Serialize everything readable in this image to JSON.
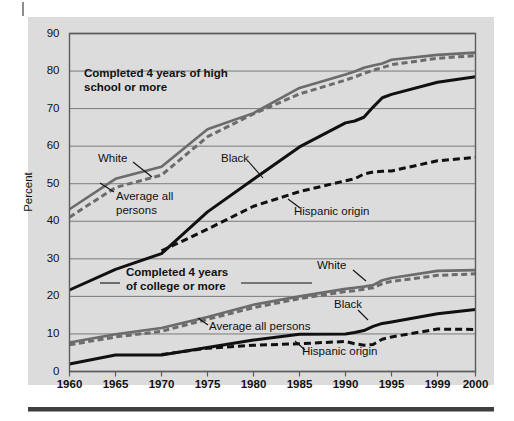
{
  "figure": {
    "background_color": "#dcdcdc",
    "plot_frame_color": "#5c5c5c",
    "gridline_color": "#6e6e6e",
    "series_gray_color": "#6b6b6b",
    "series_black_color": "#101010"
  },
  "axes": {
    "ylabel": "Percent",
    "yticks": [
      "0",
      "10",
      "20",
      "30",
      "40",
      "50",
      "60",
      "70",
      "80",
      "90"
    ],
    "xticks": [
      "1960",
      "1965",
      "1970",
      "1975",
      "1980",
      "1985",
      "1990",
      "1995",
      "1999",
      "2000"
    ]
  },
  "annotations": {
    "hs_title_line1": "Completed 4 years of high",
    "hs_title_line2": "school or more",
    "hs_white": "White",
    "hs_average_line1": "Average all",
    "hs_average_line2": "persons",
    "hs_black": "Black",
    "hs_hispanic": "Hispanic origin",
    "col_title_line1": "Completed 4 years",
    "col_title_line2": "of college or more",
    "col_white": "White",
    "col_average": "Average all persons",
    "col_black": "Black",
    "col_hispanic": "Hispanic origin"
  },
  "chart_data": {
    "type": "line",
    "title": "",
    "subtitle": "",
    "xlabel": "",
    "ylabel": "Percent",
    "xlim": [
      1960,
      2000
    ],
    "ylim": [
      0,
      90
    ],
    "grid": true,
    "legend": "inline annotations",
    "x": [
      1960,
      1965,
      1970,
      1975,
      1980,
      1985,
      1990,
      1991,
      1992,
      1993,
      1994,
      1995,
      1999,
      2000
    ],
    "series": [
      {
        "name": "Completed 4 years of high school or more - White",
        "group": "high_school",
        "style": "solid",
        "color": "#6b6b6b",
        "values": [
          43.2,
          51.3,
          54.5,
          64.5,
          68.8,
          75.5,
          79.1,
          79.9,
          80.9,
          81.5,
          82.0,
          83.0,
          84.3,
          84.9
        ]
      },
      {
        "name": "Completed 4 years of high school or more - Average all persons",
        "group": "high_school",
        "style": "dashed",
        "color": "#6b6b6b",
        "values": [
          41.1,
          49.0,
          52.3,
          62.5,
          68.6,
          73.9,
          77.6,
          78.4,
          79.4,
          80.2,
          80.9,
          81.7,
          83.4,
          84.1
        ]
      },
      {
        "name": "Completed 4 years of high school or more - Black",
        "group": "high_school",
        "style": "solid",
        "color": "#101010",
        "values": [
          21.7,
          27.2,
          31.4,
          42.5,
          51.2,
          59.8,
          66.2,
          66.7,
          67.7,
          70.4,
          72.9,
          73.8,
          77.0,
          78.5
        ]
      },
      {
        "name": "Completed 4 years of high school or more - Hispanic origin",
        "group": "high_school",
        "style": "dashed",
        "color": "#101010",
        "values": [
          null,
          null,
          32.1,
          37.9,
          44.0,
          47.9,
          50.8,
          51.3,
          52.6,
          53.1,
          53.3,
          53.4,
          56.1,
          57.0
        ]
      },
      {
        "name": "Completed 4 years of college or more - White",
        "group": "college",
        "style": "solid",
        "color": "#6b6b6b",
        "values": [
          7.7,
          9.9,
          11.6,
          14.5,
          17.8,
          20.0,
          22.0,
          22.3,
          22.6,
          23.0,
          24.3,
          24.9,
          26.8,
          27.0
        ]
      },
      {
        "name": "Completed 4 years of college or more - Average all persons",
        "group": "college",
        "style": "dashed",
        "color": "#6b6b6b",
        "values": [
          7.1,
          9.2,
          10.7,
          13.9,
          17.0,
          19.4,
          21.3,
          21.5,
          21.9,
          22.3,
          23.4,
          24.0,
          25.6,
          26.0
        ]
      },
      {
        "name": "Completed 4 years of college or more - Black",
        "group": "college",
        "style": "solid",
        "color": "#101010",
        "values": [
          2.0,
          4.4,
          4.4,
          6.4,
          8.4,
          9.9,
          10.0,
          10.4,
          10.9,
          12.0,
          12.8,
          13.2,
          15.4,
          16.5
        ]
      },
      {
        "name": "Completed 4 years of college or more - Hispanic origin",
        "group": "college",
        "style": "dashed",
        "color": "#101010",
        "values": [
          null,
          null,
          4.5,
          6.2,
          7.0,
          7.4,
          8.0,
          7.4,
          7.0,
          7.2,
          8.6,
          9.2,
          11.3,
          11.2
        ]
      }
    ]
  }
}
